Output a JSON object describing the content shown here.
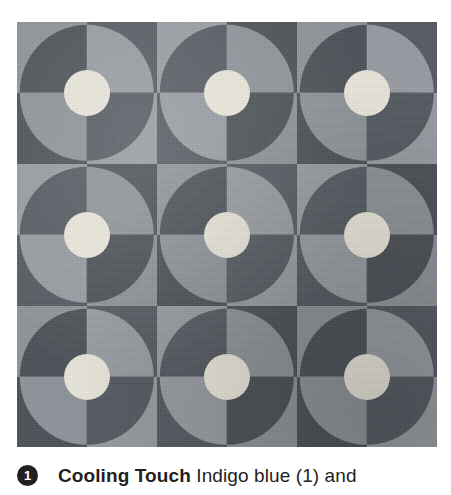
{
  "figure": {
    "name": "quilt-photograph",
    "pattern_name": "Cooling Touch",
    "grid": {
      "rows": 3,
      "cols": 3
    },
    "block": {
      "description": "two-by-two checkerboard with inscribed circle of inverted quarters and a light centre dot",
      "quadrant_order": [
        "top-left",
        "top-right",
        "bottom-left",
        "bottom-right"
      ],
      "background_quadrants": [
        "light",
        "dark",
        "dark",
        "light"
      ],
      "circle_quadrants": [
        "dark",
        "light",
        "light",
        "dark"
      ]
    },
    "colors": {
      "dark": "#4d5259",
      "dark_alt": "#565b62",
      "light": "#8f949a",
      "light_alt": "#989da3",
      "center_dot": "#e9e6da",
      "backing": "#7f858c"
    }
  },
  "caption": {
    "badge": "1",
    "title": "Cooling Touch",
    "body": " Indigo blue (1) and"
  }
}
